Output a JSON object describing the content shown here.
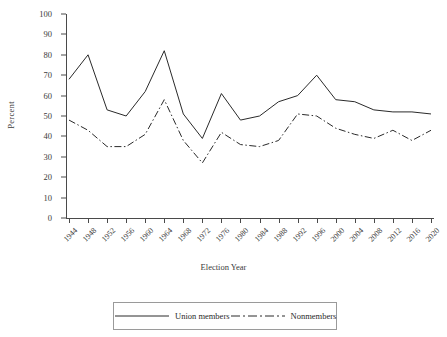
{
  "chart_data": {
    "type": "line",
    "title": "",
    "xlabel": "Election Year",
    "ylabel": "Percent",
    "ylim": [
      0,
      100
    ],
    "yticks": [
      0,
      10,
      20,
      30,
      40,
      50,
      60,
      70,
      80,
      90,
      100
    ],
    "grid": false,
    "legend_position": "bottom",
    "categories": [
      1944,
      1948,
      1952,
      1956,
      1960,
      1964,
      1968,
      1972,
      1976,
      1980,
      1984,
      1988,
      1992,
      1996,
      2000,
      2004,
      2008,
      2012,
      2016,
      2020
    ],
    "series": [
      {
        "name": "Union members",
        "style": "solid",
        "color": "#2a2a2a",
        "values": [
          68,
          80,
          53,
          50,
          62,
          82,
          51,
          39,
          61,
          48,
          50,
          57,
          60,
          70,
          58,
          57,
          53,
          52,
          52,
          51
        ]
      },
      {
        "name": "Nonmembers",
        "style": "dash-dot",
        "color": "#2a2a2a",
        "values": [
          48,
          43,
          35,
          35,
          41,
          58,
          38,
          27,
          42,
          36,
          35,
          38,
          51,
          50,
          44,
          41,
          39,
          43,
          38,
          43
        ]
      }
    ]
  },
  "axes": {
    "y_label": "Percent",
    "x_label": "Election Year",
    "y_tick_labels": [
      "0",
      "10",
      "20",
      "30",
      "40",
      "50",
      "60",
      "70",
      "80",
      "90",
      "100"
    ],
    "x_tick_labels": [
      "1944",
      "1948",
      "1952",
      "1956",
      "1960",
      "1964",
      "1968",
      "1972",
      "1976",
      "1980",
      "1984",
      "1988",
      "1992",
      "1996",
      "2000",
      "2004",
      "2008",
      "2012",
      "2016",
      "2020"
    ]
  },
  "legend": {
    "items": [
      {
        "label": "Union members",
        "style": "solid"
      },
      {
        "label": "Nonmembers",
        "style": "dash-dot"
      }
    ]
  }
}
